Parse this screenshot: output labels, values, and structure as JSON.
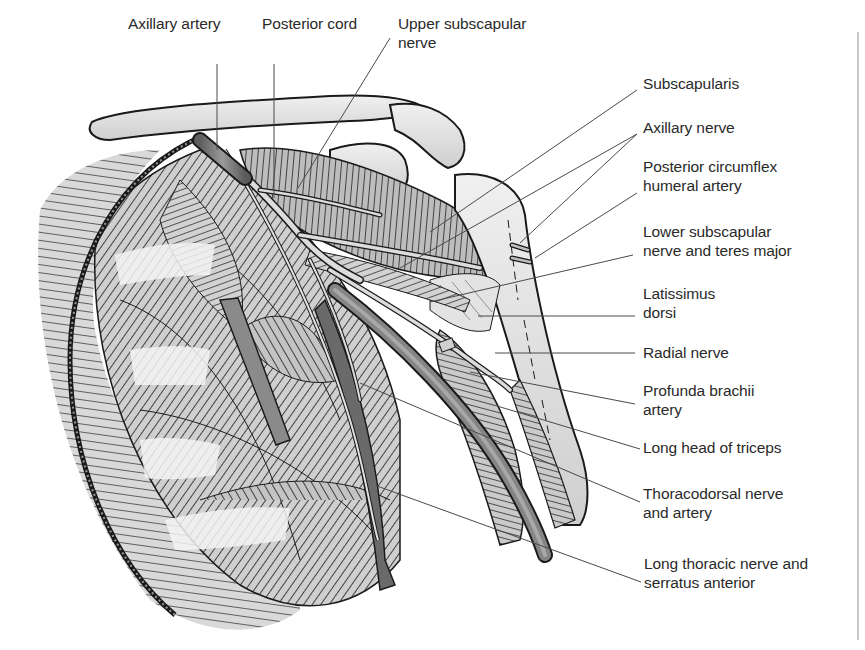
{
  "figure": {
    "colors": {
      "background": "#ffffff",
      "ink": "#1a1a1a",
      "muscle_fill": "#c9c9c9",
      "bone_fill": "#e6e6e6",
      "artery_fill": "#7a7a7a",
      "nerve_fill": "#d8d8d8",
      "leader_line": "#4a4a4a",
      "divider": "#c8c8c8"
    }
  },
  "labels": {
    "top": [
      {
        "id": "axillary-artery",
        "lines": [
          "Axillary artery"
        ],
        "x": 128,
        "y": 14
      },
      {
        "id": "posterior-cord",
        "lines": [
          "Posterior cord"
        ],
        "x": 262,
        "y": 14
      },
      {
        "id": "upper-subscapular-nerve",
        "lines": [
          "Upper subscapular",
          "nerve"
        ],
        "x": 398,
        "y": 14
      }
    ],
    "right": [
      {
        "id": "subscapularis",
        "lines": [
          "Subscapularis"
        ],
        "x": 643,
        "y": 74
      },
      {
        "id": "axillary-nerve",
        "lines": [
          "Axillary nerve"
        ],
        "x": 643,
        "y": 118
      },
      {
        "id": "posterior-circumflex-humeral-artery",
        "lines": [
          "Posterior circumflex",
          "humeral artery"
        ],
        "x": 643,
        "y": 157
      },
      {
        "id": "lower-subscapular-nerve-teres-major",
        "lines": [
          "Lower subscapular",
          "nerve and teres major"
        ],
        "x": 643,
        "y": 222
      },
      {
        "id": "latissimus-dorsi",
        "lines": [
          "Latissimus",
          "dorsi"
        ],
        "x": 643,
        "y": 284
      },
      {
        "id": "radial-nerve",
        "lines": [
          "Radial nerve"
        ],
        "x": 643,
        "y": 343
      },
      {
        "id": "profunda-brachii-artery",
        "lines": [
          "Profunda brachii",
          "artery"
        ],
        "x": 643,
        "y": 381
      },
      {
        "id": "long-head-triceps",
        "lines": [
          "Long head of triceps"
        ],
        "x": 643,
        "y": 438
      },
      {
        "id": "thoracodorsal-nerve-artery",
        "lines": [
          "Thoracodorsal nerve",
          "and artery"
        ],
        "x": 643,
        "y": 484
      },
      {
        "id": "long-thoracic-nerve-serratus-anterior",
        "lines": [
          "Long thoracic nerve and",
          "serratus anterior"
        ],
        "x": 644,
        "y": 554
      }
    ]
  },
  "leaders": [
    {
      "to": "axillary-artery",
      "points": [
        [
          217,
          64
        ],
        [
          217,
          150
        ]
      ]
    },
    {
      "to": "posterior-cord",
      "points": [
        [
          274,
          64
        ],
        [
          274,
          198
        ]
      ]
    },
    {
      "to": "upper-subscapular-nerve",
      "points": [
        [
          390,
          38
        ],
        [
          298,
          188
        ]
      ]
    },
    {
      "to": "subscapularis",
      "points": [
        [
          637,
          90
        ],
        [
          430,
          232
        ]
      ]
    },
    {
      "to": "axillary-nerve",
      "points": [
        [
          637,
          134
        ],
        [
          400,
          268
        ]
      ]
    },
    {
      "to": "axillary-nerve",
      "points": [
        [
          637,
          134
        ],
        [
          520,
          243
        ]
      ]
    },
    {
      "to": "posterior-circumflex-humeral-artery",
      "points": [
        [
          637,
          193
        ],
        [
          535,
          258
        ]
      ]
    },
    {
      "to": "lower-subscapular-nerve-teres-major",
      "points": [
        [
          633,
          255
        ],
        [
          430,
          302
        ]
      ]
    },
    {
      "to": "latissimus-dorsi",
      "points": [
        [
          635,
          316
        ],
        [
          478,
          316
        ]
      ]
    },
    {
      "to": "radial-nerve",
      "points": [
        [
          635,
          353
        ],
        [
          495,
          353
        ]
      ]
    },
    {
      "to": "profunda-brachii-artery",
      "points": [
        [
          635,
          404
        ],
        [
          470,
          372
        ]
      ]
    },
    {
      "to": "long-head-triceps",
      "points": [
        [
          640,
          449
        ],
        [
          497,
          406
        ]
      ]
    },
    {
      "to": "thoracodorsal-nerve-artery",
      "points": [
        [
          640,
          502
        ],
        [
          360,
          383
        ]
      ]
    },
    {
      "to": "long-thoracic-nerve-serratus-anterior",
      "points": [
        [
          641,
          582
        ],
        [
          377,
          486
        ]
      ]
    }
  ]
}
